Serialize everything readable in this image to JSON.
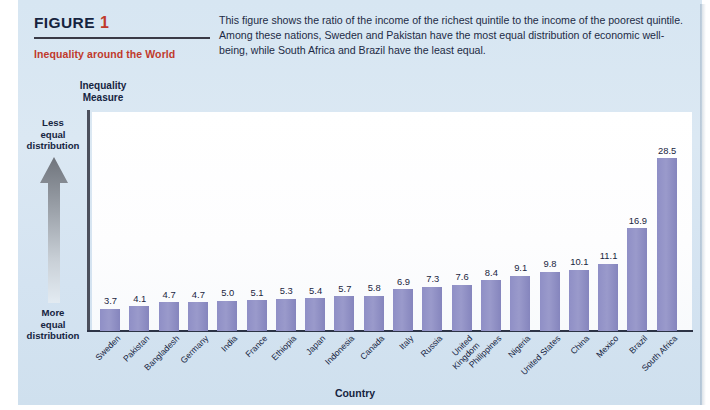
{
  "figure": {
    "label": "FIGURE",
    "number": "1",
    "subtitle": "Inequality around the World",
    "description": "This figure shows the ratio of the income of the richest quintile to the income of the poorest quintile. Among these nations, Sweden and Pakistan have the most equal distribution of economic well-being, while South Africa and Brazil have the least equal."
  },
  "annotations": {
    "less_equal": "Less equal distribution",
    "more_equal": "More equal distribution",
    "arrow_direction": "up-arrow-icon"
  },
  "colors": {
    "bar": "#9191c7",
    "panel": "#d8e7f2",
    "accent_red": "#c0392b",
    "axis": "#2d3446",
    "text": "#16243f"
  },
  "chart_data": {
    "type": "bar",
    "title": "Inequality around the World",
    "ylabel": "Inequality Measure",
    "xlabel": "Country",
    "ylim": [
      0,
      30.5
    ],
    "grid": false,
    "legend": null,
    "categories": [
      "Sweden",
      "Pakistan",
      "Bangladesh",
      "Germany",
      "India",
      "France",
      "Ethiopia",
      "Japan",
      "Indonesia",
      "Canada",
      "Italy",
      "Russia",
      "United Kingdom",
      "Philippines",
      "Nigeria",
      "United States",
      "China",
      "Mexico",
      "Brazil",
      "South Africa"
    ],
    "category_lines": [
      [
        "Sweden"
      ],
      [
        "Pakistan"
      ],
      [
        "Bangladesh"
      ],
      [
        "Germany"
      ],
      [
        "India"
      ],
      [
        "France"
      ],
      [
        "Ethiopia"
      ],
      [
        "Japan"
      ],
      [
        "Indonesia"
      ],
      [
        "Canada"
      ],
      [
        "Italy"
      ],
      [
        "Russia"
      ],
      [
        "United",
        "Kingdom"
      ],
      [
        "Philippines"
      ],
      [
        "Nigeria"
      ],
      [
        "United States"
      ],
      [
        "China"
      ],
      [
        "Mexico"
      ],
      [
        "Brazil"
      ],
      [
        "South Africa"
      ]
    ],
    "values": [
      3.7,
      4.1,
      4.7,
      4.7,
      5.0,
      5.1,
      5.3,
      5.4,
      5.7,
      5.8,
      6.9,
      7.3,
      7.6,
      8.4,
      9.1,
      9.8,
      10.1,
      11.1,
      16.9,
      28.5
    ],
    "value_labels": [
      "3.7",
      "4.1",
      "4.7",
      "4.7",
      "5.0",
      "5.1",
      "5.3",
      "5.4",
      "5.7",
      "5.8",
      "6.9",
      "7.3",
      "7.6",
      "8.4",
      "9.1",
      "9.8",
      "10.1",
      "11.1",
      "16.9",
      "28.5"
    ]
  }
}
